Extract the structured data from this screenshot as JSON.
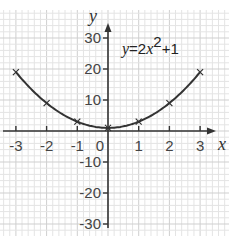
{
  "chart_data": {
    "type": "line",
    "title": "",
    "equation_label": "y=2x²+1",
    "equation_parts": {
      "lhs": "y",
      "eq": "=2",
      "var": "x",
      "exp": "2",
      "rest": "+1"
    },
    "xlabel": "x",
    "ylabel": "y",
    "xlim": [
      -3,
      3
    ],
    "ylim": [
      -30,
      30
    ],
    "x_ticks": [
      -3,
      -2,
      -1,
      0,
      1,
      2,
      3
    ],
    "x_tick_labels": [
      "-3",
      "-2",
      "-1",
      "0",
      "1",
      "2",
      "3"
    ],
    "y_ticks": [
      30,
      20,
      10,
      -10,
      -20,
      -30
    ],
    "y_tick_labels": [
      "30",
      "20",
      "10",
      "-10",
      "-20",
      "-30"
    ],
    "grid": true,
    "series": [
      {
        "name": "y=2x²+1",
        "x": [
          -3,
          -2,
          -1,
          0,
          1,
          2,
          3
        ],
        "y": [
          19,
          9,
          3,
          1,
          3,
          9,
          19
        ],
        "markers": "cross"
      }
    ],
    "colors": {
      "curve": "#333333",
      "axis": "#333333",
      "grid_minor": "#e4e4e4",
      "grid_major": "#cfcfcf"
    }
  }
}
